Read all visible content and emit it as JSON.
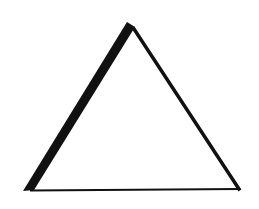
{
  "figure": {
    "shape": "triangle",
    "background_color": "#ffffff",
    "stroke_color": "#111111",
    "fill_color": "#ffffff",
    "vertices": {
      "apex": [
        130,
        23
      ],
      "bottom_left": [
        25,
        191
      ],
      "bottom_right": [
        240,
        189
      ]
    },
    "edges": {
      "left": {
        "stroke_width": 9
      },
      "right": {
        "stroke_width": 3.5
      },
      "bottom": {
        "stroke_width": 2
      }
    }
  }
}
